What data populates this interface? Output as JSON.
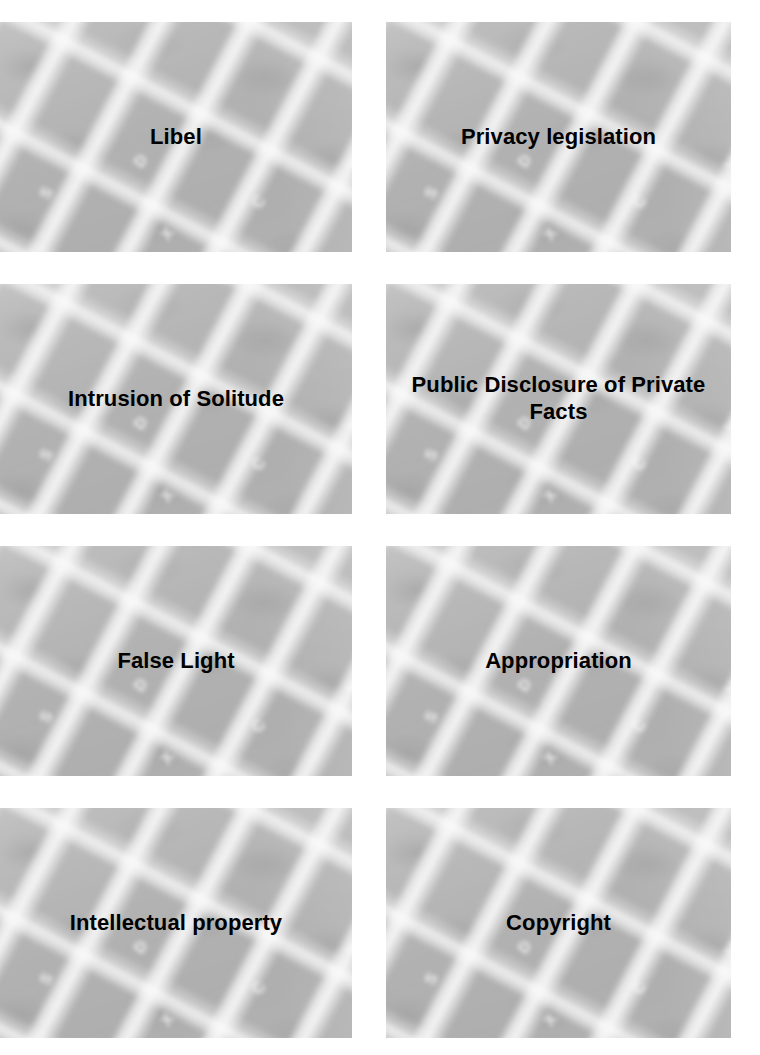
{
  "page": {
    "type": "flashcard-sheet",
    "background_color": "#ffffff",
    "columns": 2,
    "rows": 4,
    "card_background_color": "#b2b2b2",
    "card_text_color": "#000000"
  },
  "cards": [
    {
      "label": "Libel",
      "key_legends": [
        "W",
        "A",
        "S",
        "D",
        "X",
        "C",
        "V"
      ]
    },
    {
      "label": "Privacy legislation",
      "key_legends": [
        "W",
        "A",
        "S",
        "D",
        "X",
        "C",
        "V"
      ]
    },
    {
      "label": "Intrusion of Solitude",
      "key_legends": [
        "W",
        "A",
        "S",
        "D",
        "X",
        "C",
        "V"
      ]
    },
    {
      "label": "Public Disclosure of Private Facts",
      "key_legends": [
        "W",
        "A",
        "S",
        "D",
        "X",
        "C",
        "V"
      ]
    },
    {
      "label": "False Light",
      "key_legends": [
        "W",
        "A",
        "S",
        "D",
        "X",
        "C",
        "V"
      ]
    },
    {
      "label": "Appropriation",
      "key_legends": [
        "W",
        "A",
        "S",
        "D",
        "X",
        "C",
        "V"
      ]
    },
    {
      "label": "Intellectual property",
      "key_legends": [
        "W",
        "A",
        "S",
        "D",
        "X",
        "C",
        "V"
      ]
    },
    {
      "label": "Copyright",
      "key_legends": [
        "W",
        "A",
        "S",
        "D",
        "X",
        "C",
        "V"
      ]
    }
  ]
}
